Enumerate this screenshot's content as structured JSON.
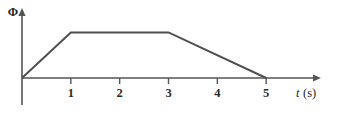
{
  "figure": {
    "background_color": "#ffffff",
    "line_color": "#4f4f4f",
    "axis_color": "#555555",
    "text_color": "#1f1f1f"
  },
  "axes": {
    "y_label": "Φ",
    "x_label_variable": "t",
    "x_label_unit": "(s)",
    "x_ticks": [
      "1",
      "2",
      "3",
      "4",
      "5"
    ]
  },
  "chart_data": {
    "type": "line",
    "title": "",
    "subtitle": "",
    "xlabel": "t (s)",
    "ylabel": "Φ",
    "grid": false,
    "legend": null,
    "xlim": [
      0,
      6
    ],
    "ylim": [
      0,
      1.25
    ],
    "x_tick_labels": [
      "1",
      "2",
      "3",
      "4",
      "5"
    ],
    "x_tick_values": [
      1,
      2,
      3,
      4,
      5
    ],
    "y_tick_labels": [],
    "y_tick_values": [],
    "series": [
      {
        "name": "Φ(t)",
        "x": [
          0,
          1,
          3,
          5
        ],
        "values": [
          0,
          1,
          1,
          0
        ],
        "color": "#4f4f4f",
        "annotations": [
          "rises linearly from 0 at t=0 to maximum at t=1 s",
          "constant at maximum from t=1 s to t=3 s",
          "falls linearly from maximum at t=3 s to 0 at t=5 s"
        ]
      }
    ]
  }
}
